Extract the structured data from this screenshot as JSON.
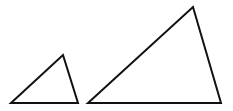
{
  "diagram": {
    "background": "#ffffff",
    "stroke_color": "#111111",
    "stroke_width": 2,
    "shapes": [
      {
        "name": "small-triangle",
        "points": "11,103 63,55 78,103"
      },
      {
        "name": "large-triangle",
        "points": "88,103 193,7 221,103"
      }
    ]
  }
}
